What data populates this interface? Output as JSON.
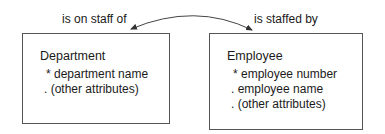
{
  "relationship": {
    "left_label": "is on staff of",
    "right_label": "is staffed by"
  },
  "entities": [
    {
      "name": "Department",
      "attributes": [
        {
          "marker": "*",
          "text": "department name"
        },
        {
          "marker": ".",
          "text": "(other attributes)"
        }
      ]
    },
    {
      "name": "Employee",
      "attributes": [
        {
          "marker": "*",
          "text": "employee number"
        },
        {
          "marker": ".",
          "text": "employee name"
        },
        {
          "marker": ".",
          "text": "(other attributes)"
        }
      ]
    }
  ],
  "colors": {
    "line": "#444444",
    "text": "#1a1a1a"
  }
}
